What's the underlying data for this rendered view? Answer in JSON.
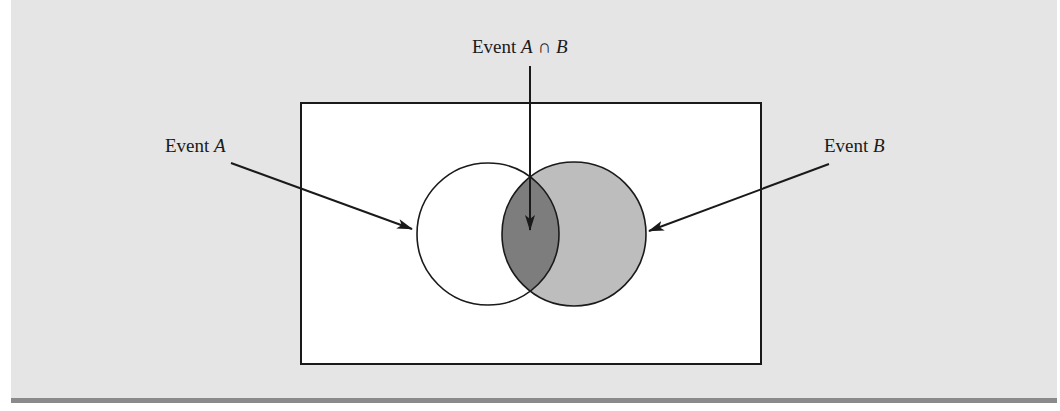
{
  "labels": {
    "event_a": {
      "prefix": "Event ",
      "var": "A"
    },
    "event_b": {
      "prefix": "Event ",
      "var": "B"
    },
    "intersection": {
      "prefix": "Event ",
      "var_a": "A",
      "symbol": " ∩ ",
      "var_b": "B"
    }
  },
  "sets": [
    {
      "name": "A",
      "fill": "#ffffff"
    },
    {
      "name": "B",
      "fill": "#bdbdbd"
    }
  ],
  "intersection_fill": "#7d7d7d",
  "panel_background": "#e5e5e5",
  "sample_space_fill": "#ffffff"
}
